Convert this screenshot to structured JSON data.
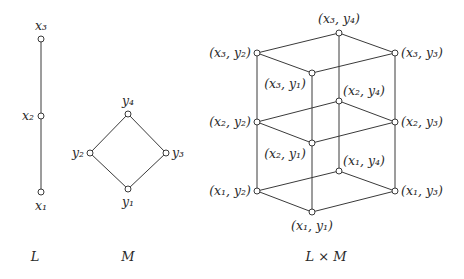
{
  "diagrams": [
    {
      "id": "L",
      "caption": "L",
      "caption_pos": [
        35,
        261
      ],
      "nodes": [
        {
          "id": "x1",
          "label": "x₁",
          "x": 41,
          "y": 192,
          "lx": 41,
          "ly": 210,
          "anchor": "middle"
        },
        {
          "id": "x2",
          "label": "x₂",
          "x": 41,
          "y": 116,
          "lx": 34,
          "ly": 120,
          "anchor": "end"
        },
        {
          "id": "x3",
          "label": "x₃",
          "x": 41,
          "y": 39,
          "lx": 41,
          "ly": 30,
          "anchor": "middle"
        }
      ],
      "edges": [
        [
          "x1",
          "x2"
        ],
        [
          "x2",
          "x3"
        ]
      ]
    },
    {
      "id": "M",
      "caption": "M",
      "caption_pos": [
        128,
        261
      ],
      "nodes": [
        {
          "id": "y1",
          "label": "y₁",
          "x": 128,
          "y": 189,
          "lx": 128,
          "ly": 206,
          "anchor": "middle"
        },
        {
          "id": "y2",
          "label": "y₂",
          "x": 90,
          "y": 153,
          "lx": 84,
          "ly": 157,
          "anchor": "end"
        },
        {
          "id": "y3",
          "label": "y₃",
          "x": 166,
          "y": 153,
          "lx": 172,
          "ly": 157,
          "anchor": "start"
        },
        {
          "id": "y4",
          "label": "y₄",
          "x": 128,
          "y": 114,
          "lx": 128,
          "ly": 105,
          "anchor": "middle"
        }
      ],
      "edges": [
        [
          "y1",
          "y2"
        ],
        [
          "y1",
          "y3"
        ],
        [
          "y2",
          "y4"
        ],
        [
          "y3",
          "y4"
        ]
      ]
    },
    {
      "id": "LxM",
      "caption": "L × M",
      "caption_pos": [
        326,
        261
      ],
      "nodes": [
        {
          "id": "x1y1",
          "label": "(x₁, y₁)",
          "x": 312,
          "y": 212,
          "lx": 312,
          "ly": 230,
          "anchor": "middle"
        },
        {
          "id": "x1y2",
          "label": "(x₁, y₂)",
          "x": 257,
          "y": 191,
          "lx": 251,
          "ly": 195,
          "anchor": "end"
        },
        {
          "id": "x1y3",
          "label": "(x₁, y₃)",
          "x": 395,
          "y": 191,
          "lx": 401,
          "ly": 195,
          "anchor": "start"
        },
        {
          "id": "x1y4",
          "label": "(x₁, y₄)",
          "x": 339,
          "y": 171,
          "lx": 343,
          "ly": 165,
          "anchor": "start"
        },
        {
          "id": "x2y1",
          "label": "(x₂, y₁)",
          "x": 312,
          "y": 143,
          "lx": 306,
          "ly": 158,
          "anchor": "end"
        },
        {
          "id": "x2y2",
          "label": "(x₂, y₂)",
          "x": 257,
          "y": 122,
          "lx": 251,
          "ly": 126,
          "anchor": "end"
        },
        {
          "id": "x2y3",
          "label": "(x₂, y₃)",
          "x": 395,
          "y": 122,
          "lx": 401,
          "ly": 126,
          "anchor": "start"
        },
        {
          "id": "x2y4",
          "label": "(x₂, y₄)",
          "x": 339,
          "y": 101,
          "lx": 343,
          "ly": 95,
          "anchor": "start"
        },
        {
          "id": "x3y1",
          "label": "(x₃, y₁)",
          "x": 312,
          "y": 73,
          "lx": 306,
          "ly": 88,
          "anchor": "end"
        },
        {
          "id": "x3y2",
          "label": "(x₃, y₂)",
          "x": 257,
          "y": 53,
          "lx": 251,
          "ly": 57,
          "anchor": "end"
        },
        {
          "id": "x3y3",
          "label": "(x₃, y₃)",
          "x": 395,
          "y": 53,
          "lx": 401,
          "ly": 57,
          "anchor": "start"
        },
        {
          "id": "x3y4",
          "label": "(x₃, y₄)",
          "x": 339,
          "y": 33,
          "lx": 339,
          "ly": 23,
          "anchor": "middle"
        }
      ],
      "edges": [
        [
          "x1y1",
          "x1y2"
        ],
        [
          "x1y1",
          "x1y3"
        ],
        [
          "x1y2",
          "x1y4"
        ],
        [
          "x1y3",
          "x1y4"
        ],
        [
          "x2y1",
          "x2y2"
        ],
        [
          "x2y1",
          "x2y3"
        ],
        [
          "x2y2",
          "x2y4"
        ],
        [
          "x2y3",
          "x2y4"
        ],
        [
          "x3y1",
          "x3y2"
        ],
        [
          "x3y1",
          "x3y3"
        ],
        [
          "x3y2",
          "x3y4"
        ],
        [
          "x3y3",
          "x3y4"
        ],
        [
          "x1y1",
          "x2y1"
        ],
        [
          "x2y1",
          "x3y1"
        ],
        [
          "x1y2",
          "x2y2"
        ],
        [
          "x2y2",
          "x3y2"
        ],
        [
          "x1y3",
          "x2y3"
        ],
        [
          "x2y3",
          "x3y3"
        ],
        [
          "x1y4",
          "x2y4"
        ],
        [
          "x2y4",
          "x3y4"
        ]
      ]
    }
  ],
  "colors": {
    "line": "#3a3a3a",
    "text": "#2a2a2a",
    "background": "#ffffff"
  }
}
